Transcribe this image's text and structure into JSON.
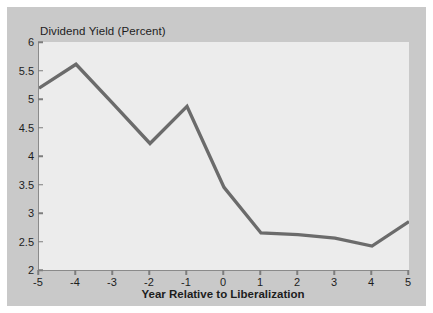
{
  "figure": {
    "background_color": "#ffffff",
    "panel_color": "#c9c9c9",
    "plot_background_color": "#ececec",
    "line_color": "#6b6b6b",
    "axis_color": "#8a8a8a",
    "text_color": "#1d1d1d"
  },
  "chart_data": {
    "type": "line",
    "title": "Dividend Yield (Percent)",
    "xlabel": "Year Relative to Liberalization",
    "ylabel": "",
    "x": [
      -5,
      -4,
      -3,
      -2,
      -1,
      0,
      1,
      2,
      3,
      4,
      5
    ],
    "values": [
      5.19,
      5.61,
      4.92,
      4.22,
      4.87,
      3.45,
      2.65,
      2.62,
      2.56,
      2.42,
      2.85
    ],
    "series": [
      {
        "name": "Dividend Yield",
        "values": [
          5.19,
          5.61,
          4.92,
          4.22,
          4.87,
          3.45,
          2.65,
          2.62,
          2.56,
          2.42,
          2.85
        ]
      }
    ],
    "xlim": [
      -5,
      5
    ],
    "ylim": [
      2,
      6
    ],
    "xticks": [
      -5,
      -4,
      -3,
      -2,
      -1,
      0,
      1,
      2,
      3,
      4,
      5
    ],
    "xtick_labels": [
      "-5",
      "-4",
      "-3",
      "-2",
      "-1",
      "0",
      "1",
      "2",
      "3",
      "4",
      "5"
    ],
    "yticks": [
      2,
      2.5,
      3,
      3.5,
      4,
      4.5,
      5,
      5.5,
      6
    ],
    "ytick_labels": [
      "2",
      "2.5",
      "3",
      "3.5",
      "4",
      "4.5",
      "5",
      "5.5",
      "6"
    ],
    "grid": false,
    "legend": null,
    "legend_position": "none",
    "annotations": []
  }
}
